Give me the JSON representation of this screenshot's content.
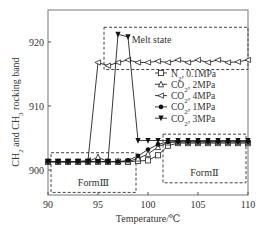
{
  "chart_data": {
    "type": "line",
    "title": "",
    "xlabel": "Temperature/℃",
    "ylabel": "CH2 and CH3 rocking band",
    "xlim": [
      90,
      110
    ],
    "ylim": [
      895,
      924
    ],
    "xticks": [
      90,
      95,
      100,
      105,
      110
    ],
    "yticks": [
      900,
      910,
      920
    ],
    "grid": false,
    "legend_position": "inside-right",
    "series": [
      {
        "name": "N2, 0.1MPa",
        "marker": "square-open",
        "x": [
          90,
          91,
          92,
          93,
          94,
          95,
          96,
          97,
          98,
          99,
          100,
          101,
          102,
          103,
          104,
          105,
          106,
          107,
          108,
          109,
          110
        ],
        "values": [
          901.3,
          901.3,
          901.3,
          901.3,
          901.3,
          901.3,
          901.3,
          901.3,
          901.3,
          901.4,
          901.5,
          902.3,
          903.8,
          904.2,
          904.2,
          904.2,
          904.2,
          904.2,
          904.2,
          904.2,
          904.2
        ]
      },
      {
        "name": "CO2, 2MPa",
        "marker": "triangle-up-open",
        "x": [
          90,
          91,
          92,
          93,
          94,
          95,
          96,
          97,
          98,
          99,
          100,
          101,
          102,
          103,
          104,
          105,
          106,
          107,
          108,
          109,
          110
        ],
        "values": [
          901.3,
          901.3,
          901.3,
          901.3,
          901.3,
          902.0,
          901.3,
          901.3,
          901.3,
          901.8,
          902.5,
          903.6,
          904.3,
          904.4,
          904.4,
          904.4,
          904.4,
          904.4,
          904.4,
          904.4,
          904.4
        ]
      },
      {
        "name": "CO2, 4MPa",
        "marker": "triangle-left-open",
        "x": [
          90,
          91,
          92,
          93,
          94,
          95,
          96,
          97,
          98,
          99,
          100,
          101,
          102,
          103,
          104,
          105,
          106,
          107,
          108,
          109,
          110
        ],
        "values": [
          901.3,
          901.3,
          901.3,
          901.3,
          901.5,
          916.8,
          916.3,
          916.8,
          917.2,
          916.8,
          916.8,
          917.0,
          916.8,
          917.2,
          916.8,
          917.2,
          916.8,
          917.2,
          916.8,
          916.9,
          917.2
        ]
      },
      {
        "name": "CO2, 1MPa",
        "marker": "circle-filled",
        "x": [
          90,
          91,
          92,
          93,
          94,
          95,
          96,
          97,
          98,
          99,
          100,
          101,
          102,
          103,
          104,
          105,
          106,
          107,
          108,
          109,
          110
        ],
        "values": [
          901.3,
          901.3,
          901.3,
          901.3,
          901.3,
          901.3,
          901.3,
          901.3,
          901.5,
          902.2,
          903.2,
          904.0,
          904.4,
          904.4,
          904.4,
          904.4,
          904.4,
          904.4,
          904.4,
          904.4,
          904.4
        ]
      },
      {
        "name": "CO2, 3MPa",
        "marker": "triangle-down-filled",
        "x": [
          90,
          91,
          92,
          93,
          94,
          95,
          96,
          97,
          98,
          99,
          100,
          101,
          102,
          103,
          104,
          105,
          106,
          107,
          108,
          109,
          110
        ],
        "values": [
          901.3,
          901.3,
          901.3,
          901.3,
          901.3,
          901.3,
          901.3,
          921.2,
          920.8,
          904.6,
          904.6,
          904.6,
          904.6,
          904.6,
          904.6,
          904.6,
          904.6,
          904.6,
          904.6,
          904.6,
          904.6
        ]
      }
    ],
    "annotations": [
      {
        "text": "Melt state",
        "box": {
          "x0": 95.6,
          "x1": 110,
          "y0": 915.7,
          "y1": 922.3
        }
      },
      {
        "text": "FormⅢ",
        "box": {
          "x0": 90.3,
          "x1": 98.8,
          "y0": 896.5,
          "y1": 902.7
        }
      },
      {
        "text": "FormⅡ",
        "box": {
          "x0": 101.5,
          "x1": 109.8,
          "y0": 898.0,
          "y1": 905.6
        }
      }
    ]
  },
  "labels": {
    "xlabel": "Temperature/℃",
    "ylabel_main": "CH",
    "ylabel_full": "CH2 and CH3 rocking band",
    "melt": "Melt state",
    "form3": "FormⅢ",
    "form2": "FormⅡ"
  }
}
